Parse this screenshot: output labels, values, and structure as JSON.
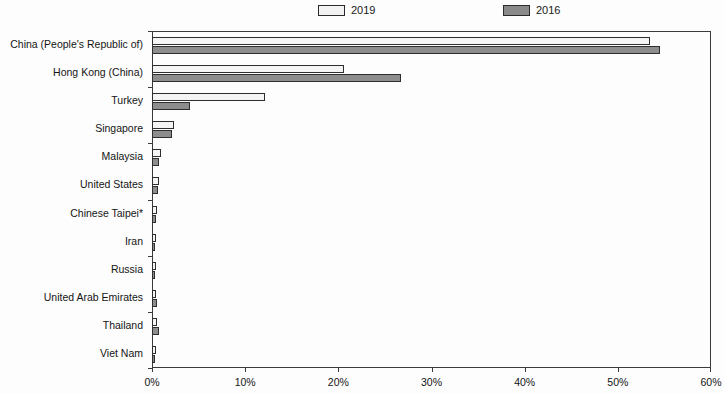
{
  "chart_data": {
    "type": "bar",
    "orientation": "horizontal",
    "title": "",
    "subtitle": "",
    "xlabel": "",
    "ylabel": "",
    "xlim": [
      0,
      60
    ],
    "xticks": [
      0,
      10,
      20,
      30,
      40,
      50,
      60
    ],
    "xticklabels": [
      "0%",
      "10%",
      "20%",
      "30%",
      "40%",
      "50%",
      "60%"
    ],
    "grid": false,
    "legend_position": "top",
    "value_unit": "%",
    "categories": [
      "China (People's Republic of)",
      "Hong Kong (China)",
      "Turkey",
      "Singapore",
      "Malaysia",
      "United States",
      "Chinese Taipei*",
      "Iran",
      "Russia",
      "United Arab Emirates",
      "Thailand",
      "Viet Nam"
    ],
    "series": [
      {
        "name": "2019",
        "color": "#f4f4f4",
        "values": [
          53.5,
          20.6,
          12.1,
          2.4,
          1.0,
          0.7,
          0.5,
          0.4,
          0.4,
          0.4,
          0.5,
          0.4
        ]
      },
      {
        "name": "2016",
        "color": "#8d8d8d",
        "values": [
          54.5,
          26.7,
          4.1,
          2.1,
          0.8,
          0.6,
          0.4,
          0.3,
          0.3,
          0.5,
          0.8,
          0.3
        ]
      }
    ]
  },
  "legend": {
    "entries": [
      {
        "label": "2019",
        "swatch": "legend-swatch-2019"
      },
      {
        "label": "2016",
        "swatch": "legend-swatch-2016"
      }
    ]
  },
  "colors": {
    "series_2019": "#f4f4f4",
    "series_2016": "#8d8d8d",
    "axis": "#3a3a3a",
    "text": "#141414",
    "background": "#fdfdfd"
  }
}
